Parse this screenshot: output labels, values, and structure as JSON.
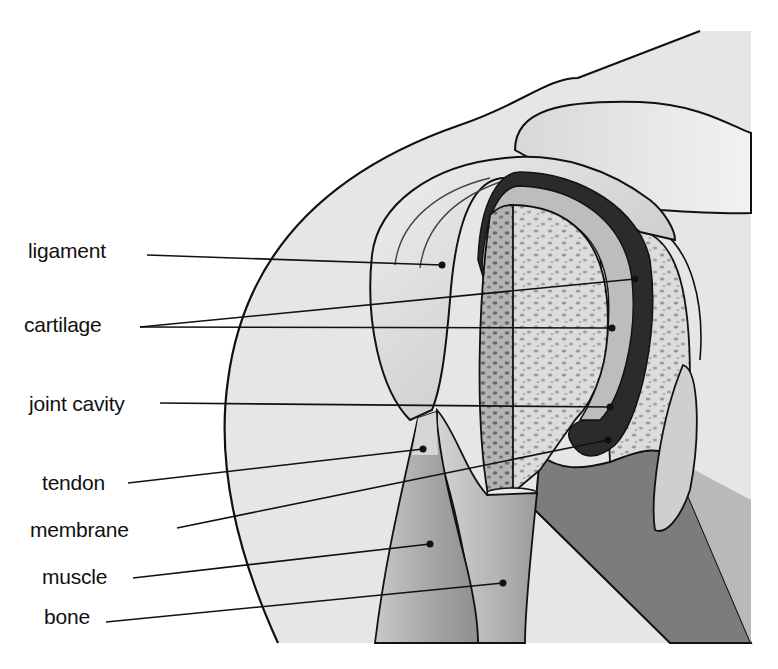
{
  "diagram": {
    "colors": {
      "background": "#ffffff",
      "skin": "#e6e6e6",
      "outline": "#111111",
      "bone_spongy": "#d8d8d8",
      "bone_dark": "#8a8a8a",
      "cartilage": "#bdbdbd",
      "cavity": "#2b2b2b",
      "muscle": "#a9a9a9",
      "muscle_dark": "#6e6e6e",
      "tendon": "#cfcfcf"
    },
    "labels": [
      {
        "id": "ligament",
        "text": "ligament",
        "x": 28,
        "y": 240,
        "targets": [
          [
            442,
            265
          ]
        ]
      },
      {
        "id": "cartilage",
        "text": "cartilage",
        "x": 24,
        "y": 314,
        "targets": [
          [
            635,
            279
          ],
          [
            612,
            328
          ]
        ]
      },
      {
        "id": "joint-cavity",
        "text": "joint cavity",
        "x": 29,
        "y": 393,
        "targets": [
          [
            610,
            407
          ]
        ]
      },
      {
        "id": "tendon",
        "text": "tendon",
        "x": 42,
        "y": 472,
        "targets": [
          [
            423,
            449
          ]
        ]
      },
      {
        "id": "membrane",
        "text": "membrane",
        "x": 30,
        "y": 519,
        "targets": [
          [
            608,
            440
          ]
        ]
      },
      {
        "id": "muscle",
        "text": "muscle",
        "x": 42,
        "y": 566,
        "targets": [
          [
            430,
            544
          ]
        ]
      },
      {
        "id": "bone",
        "text": "bone",
        "x": 44,
        "y": 606,
        "targets": [
          [
            503,
            583
          ]
        ]
      }
    ]
  }
}
